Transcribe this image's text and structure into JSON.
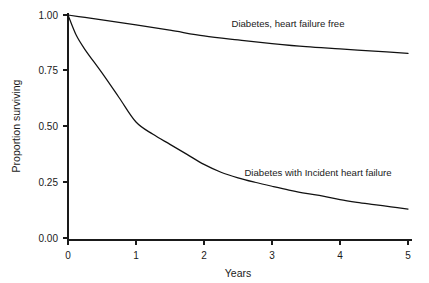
{
  "chart_data": {
    "type": "line",
    "title": "",
    "subtitle": "",
    "xlabel": "Years",
    "ylabel": "Proportion surviving",
    "xlim": [
      0,
      5
    ],
    "ylim": [
      0,
      1
    ],
    "grid": false,
    "legend_position": "inline-annotations",
    "x_ticks": [
      "0",
      "1",
      "2",
      "3",
      "4",
      "5"
    ],
    "x_tick_values": [
      0,
      1,
      2,
      3,
      4,
      5
    ],
    "y_ticks": [
      "0.00",
      "0.25",
      "0.50",
      "0.75",
      "1.00"
    ],
    "y_tick_values": [
      0.0,
      0.25,
      0.5,
      0.75,
      1.0
    ],
    "series": [
      {
        "name": "Diabetes, heart failure free",
        "annotation": "Diabetes, heart failure free",
        "color": "#111111",
        "x": [
          0.0,
          0.25,
          0.5,
          1.0,
          1.5,
          2.0,
          2.5,
          3.0,
          3.5,
          4.0,
          4.5,
          5.0
        ],
        "values": [
          1.0,
          0.989,
          0.978,
          0.956,
          0.932,
          0.906,
          0.888,
          0.872,
          0.858,
          0.848,
          0.838,
          0.828
        ]
      },
      {
        "name": "Diabetes with Incident heart failure",
        "annotation": "Diabetes with Incident heart failure",
        "color": "#111111",
        "x": [
          0.0,
          0.12,
          0.25,
          0.5,
          0.75,
          1.0,
          1.25,
          1.5,
          1.75,
          2.0,
          2.25,
          2.5,
          2.75,
          3.0,
          3.25,
          3.5,
          3.75,
          4.0,
          4.25,
          4.5,
          4.75,
          5.0
        ],
        "values": [
          1.0,
          0.91,
          0.845,
          0.74,
          0.63,
          0.52,
          0.465,
          0.42,
          0.375,
          0.33,
          0.295,
          0.27,
          0.25,
          0.232,
          0.215,
          0.2,
          0.188,
          0.172,
          0.16,
          0.15,
          0.14,
          0.13
        ]
      }
    ],
    "annotations": [
      {
        "text": "Diabetes, heart failure free",
        "x": 3.2,
        "y": 0.985
      },
      {
        "text": "Diabetes with Incident heart failure",
        "x": 2.45,
        "y": 0.305
      }
    ]
  }
}
